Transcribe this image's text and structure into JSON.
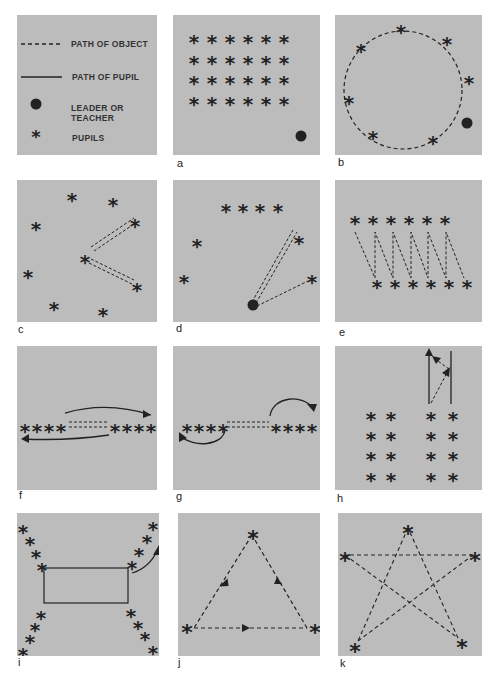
{
  "legend": {
    "items": [
      {
        "symbol": "dashed-line",
        "label": "PATH OF OBJECT"
      },
      {
        "symbol": "solid-line",
        "label": "PATH OF PUPIL"
      },
      {
        "symbol": "filled-circle",
        "label": "LEADER OR TEACHER"
      },
      {
        "symbol": "asterisk",
        "label": "PUPILS"
      }
    ]
  },
  "panels": [
    {
      "id": "a",
      "label": "a",
      "description": "Pupils in 4 rows of 6 facing leader"
    },
    {
      "id": "b",
      "label": "b",
      "description": "Pupils in circle with leader, object passed around circle"
    },
    {
      "id": "c",
      "label": "c",
      "description": "Scattered pupils, center pupil throws object to two others"
    },
    {
      "id": "d",
      "label": "d",
      "description": "Leader throws object to pupils in semicircle"
    },
    {
      "id": "e",
      "label": "e",
      "description": "Two lines, object zigzags between lines"
    },
    {
      "id": "f",
      "label": "f",
      "description": "Two lines of four, object passed, pupils run to opposite end"
    },
    {
      "id": "g",
      "label": "g",
      "description": "Two lines of four, object passed, pupils loop back to end of own line"
    },
    {
      "id": "h",
      "label": "h",
      "description": "Four columns, pupil runs forward and receives object"
    },
    {
      "id": "i",
      "label": "i",
      "description": "Four diagonal lines at corners of rectangle, pupil runs around"
    },
    {
      "id": "j",
      "label": "j",
      "description": "Triangle of three pupils passing object"
    },
    {
      "id": "k",
      "label": "k",
      "description": "Star pattern of five pupils passing object"
    }
  ],
  "symbols": {
    "pupil": "*"
  },
  "colors": {
    "panel_bg": "#bcbcbc",
    "ink": "#222222",
    "page_bg": "#ffffff"
  }
}
